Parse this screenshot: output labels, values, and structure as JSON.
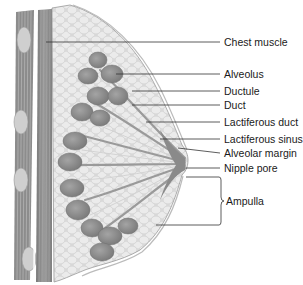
{
  "figure": {
    "labels": [
      {
        "id": "chest-muscle",
        "text": "Chest muscle",
        "x": 224,
        "y": 36
      },
      {
        "id": "alveolus",
        "text": "Alveolus",
        "x": 224,
        "y": 69
      },
      {
        "id": "ductule",
        "text": "Ductule",
        "x": 224,
        "y": 86
      },
      {
        "id": "duct",
        "text": "Duct",
        "x": 224,
        "y": 100
      },
      {
        "id": "lactiferous-duct",
        "text": "Lactiferous duct",
        "x": 224,
        "y": 117
      },
      {
        "id": "lactiferous-sinus",
        "text": "Lactiferous sinus",
        "x": 224,
        "y": 134
      },
      {
        "id": "alveolar-margin",
        "text": "Alveolar margin",
        "x": 224,
        "y": 148
      },
      {
        "id": "nipple-pore",
        "text": "Nipple pore",
        "x": 224,
        "y": 164
      },
      {
        "id": "ampulla",
        "text": "Ampulla",
        "x": 226,
        "y": 196
      }
    ]
  },
  "colors": {
    "muscle": "#8a8a8a",
    "muscle_stripe": "#a8a8a8",
    "fat": "#e2e2e2",
    "fat_outline": "#c4c4c4",
    "lobule": "#8f8f8f",
    "duct": "#b4b4b4",
    "skin": "#f4f4f4",
    "leader": "#333333"
  }
}
